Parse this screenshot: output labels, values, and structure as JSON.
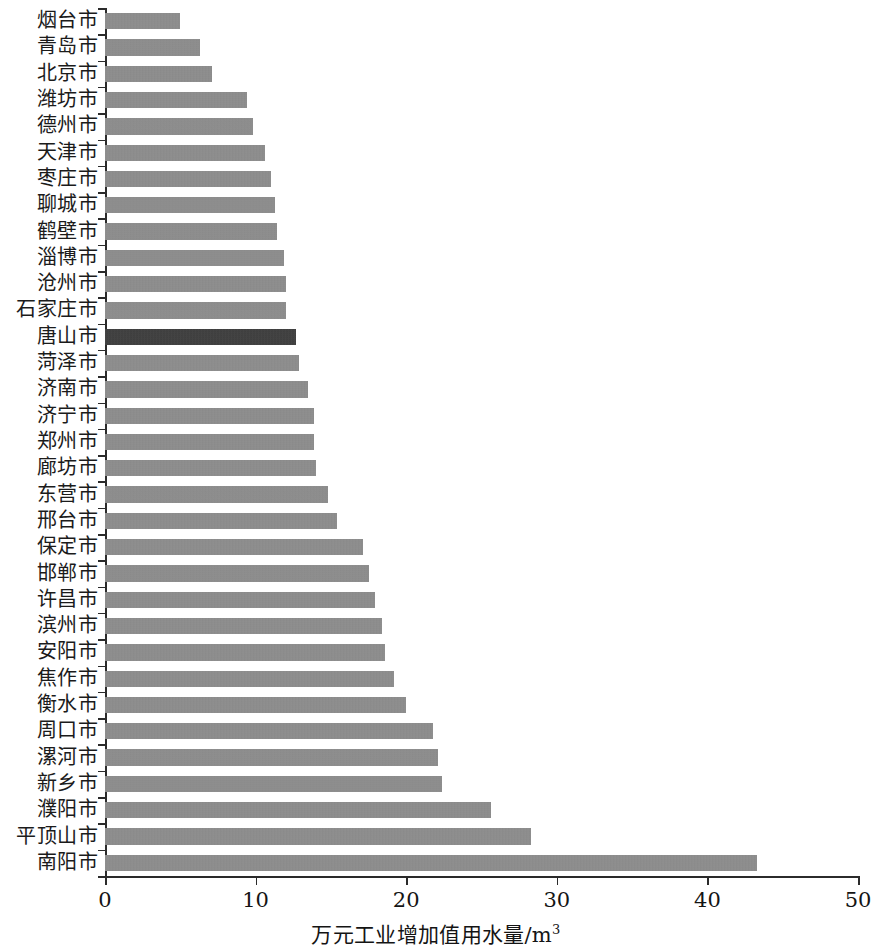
{
  "chart_data": {
    "type": "bar",
    "orientation": "horizontal",
    "title": "",
    "xlabel": "万元工业增加值用水量/m³",
    "ylabel": "",
    "xlim": [
      0,
      50
    ],
    "xticks": [
      0,
      10,
      20,
      30,
      40,
      50
    ],
    "xtick_labels": [
      "0",
      "10",
      "20",
      "30",
      "40",
      "50"
    ],
    "grid": false,
    "legend": "none",
    "highlight_category": "唐山市",
    "colors": {
      "bar": "#8c8c8c",
      "bar_highlight": "#3a3a3a",
      "axis": "#2b2b2b",
      "text": "#141414",
      "background": "#ffffff"
    },
    "categories": [
      "烟台市",
      "青岛市",
      "北京市",
      "潍坊市",
      "德州市",
      "天津市",
      "枣庄市",
      "聊城市",
      "鹤壁市",
      "淄博市",
      "沧州市",
      "石家庄市",
      "唐山市",
      "菏泽市",
      "济南市",
      "济宁市",
      "郑州市",
      "廊坊市",
      "东营市",
      "邢台市",
      "保定市",
      "邯郸市",
      "许昌市",
      "滨州市",
      "安阳市",
      "焦作市",
      "衡水市",
      "周口市",
      "漯河市",
      "新乡市",
      "濮阳市",
      "平顶山市",
      "南阳市"
    ],
    "values": [
      5.0,
      6.3,
      7.1,
      9.4,
      9.8,
      10.6,
      11.0,
      11.3,
      11.4,
      11.9,
      12.0,
      12.0,
      12.7,
      12.9,
      13.5,
      13.9,
      13.9,
      14.0,
      14.8,
      15.4,
      17.1,
      17.5,
      17.9,
      18.4,
      18.6,
      19.2,
      20.0,
      21.8,
      22.1,
      22.4,
      25.6,
      28.3,
      43.3
    ],
    "units": "m³ per 10000 yuan of industrial added value",
    "sorted": "ascending"
  }
}
